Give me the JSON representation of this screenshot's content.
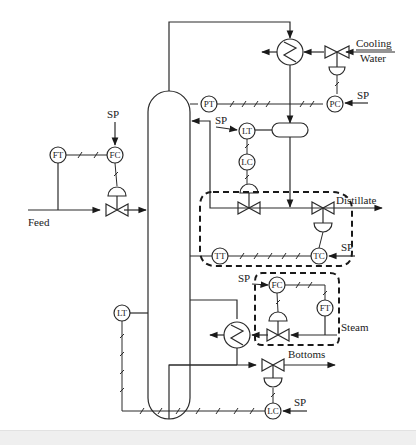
{
  "diagram": {
    "colors": {
      "line": "#2a2a2a",
      "background": "#ffffff"
    },
    "streams": {
      "feed": "Feed",
      "cooling_water_line1": "Cooling",
      "cooling_water_line2": "Water",
      "distillate": "Distillate",
      "steam": "Steam",
      "bottoms": "Bottoms"
    },
    "setpoints": {
      "feed_fc": "SP",
      "pc": "SP",
      "lt_top": "SP",
      "tc": "SP",
      "steam_fc": "SP",
      "bottoms_lc": "SP"
    },
    "instruments": {
      "feed_ft": "FT",
      "feed_fc": "FC",
      "pt": "PT",
      "pc": "PC",
      "reflux_lt": "LT",
      "reflux_lc": "LC",
      "tt": "TT",
      "tc": "TC",
      "steam_fc": "FC",
      "steam_ft": "FT",
      "bottom_lt": "LT",
      "bottom_lc": "LC"
    },
    "equipment": [
      "distillation-column",
      "condenser",
      "reflux-drum",
      "reboiler"
    ],
    "control_groups": [
      "distillate-temperature-loop",
      "steam-flow-loop"
    ]
  }
}
